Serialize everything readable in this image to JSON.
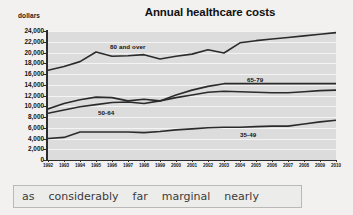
{
  "chart_data": {
    "type": "line",
    "title": "Annual healthcare costs",
    "xlabel": "",
    "ylabel": "dollars",
    "ylim": [
      0,
      24000
    ],
    "ytick_step": 2000,
    "yticks": [
      "0",
      "2,000",
      "4,000",
      "6,000",
      "8,000",
      "10,000",
      "12,000",
      "14,000",
      "16,000",
      "18,000",
      "20,000",
      "22,000",
      "24,000"
    ],
    "grid": true,
    "legend_position": "inline-labels",
    "categories": [
      "1992",
      "1993",
      "1994",
      "1995",
      "1996",
      "1997",
      "1998",
      "1999",
      "2000",
      "2001",
      "2002",
      "2003",
      "2004",
      "2005",
      "2006",
      "2007",
      "2008",
      "2009",
      "2010"
    ],
    "x": [
      1992,
      1993,
      1994,
      1995,
      1996,
      1997,
      1998,
      1999,
      2000,
      2001,
      2002,
      2003,
      2004,
      2005,
      2006,
      2007,
      2008,
      2009,
      2010
    ],
    "series": [
      {
        "name": "80 and over",
        "color": "#2b2b2b",
        "values": [
          16700,
          17400,
          18300,
          20100,
          19300,
          19400,
          19600,
          18800,
          19300,
          19700,
          20500,
          19900,
          21800,
          22200,
          22500,
          22800,
          23100,
          23400,
          23700
        ]
      },
      {
        "name": "65-79",
        "color": "#2b2b2b",
        "values": [
          8700,
          9300,
          9900,
          10300,
          10700,
          10800,
          10500,
          11000,
          12100,
          13000,
          13700,
          14200,
          14200,
          14200,
          14200,
          14200,
          14200,
          14200,
          14200
        ]
      },
      {
        "name": "50-64",
        "color": "#2b2b2b",
        "values": [
          9500,
          10500,
          11200,
          11700,
          11600,
          11000,
          11300,
          11000,
          11600,
          12100,
          12600,
          12800,
          12700,
          12600,
          12500,
          12500,
          12700,
          12900,
          13000
        ]
      },
      {
        "name": "35-49",
        "color": "#2b2b2b",
        "values": [
          4000,
          4200,
          5200,
          5200,
          5200,
          5200,
          5100,
          5300,
          5600,
          5800,
          6000,
          6100,
          6100,
          6200,
          6300,
          6300,
          6700,
          7100,
          7400
        ]
      }
    ],
    "series_label_positions": [
      {
        "name": "80 and over",
        "left": 110,
        "top": 43
      },
      {
        "name": "65-79",
        "left": 247,
        "top": 76
      },
      {
        "name": "50-64",
        "left": 98,
        "top": 109
      },
      {
        "name": "35-49",
        "left": 240,
        "top": 131
      }
    ]
  },
  "wordbank": {
    "words": [
      "as",
      "considerably",
      "far",
      "marginal",
      "nearly"
    ]
  },
  "colors": {
    "page_background": "#f2f1ef",
    "plot_background": "#dcdcdc",
    "gridline": "#f4f4f4",
    "line": "#2b2b2b",
    "axis": "#2b2b2b",
    "wordbank_background": "#ececea",
    "wordbank_border": "#b9b9b7",
    "text": "#111111"
  }
}
